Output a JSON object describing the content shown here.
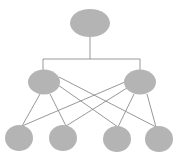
{
  "diagram": {
    "type": "hierarchy",
    "colors": {
      "node_fill": "#b4b4b4",
      "edge": "#8c8c8c",
      "background": "#ffffff"
    },
    "nodes": [
      {
        "id": "root",
        "level": 0,
        "cx": 90,
        "cy": 23,
        "rx": 20,
        "ry": 14
      },
      {
        "id": "mid-left",
        "level": 1,
        "cx": 44,
        "cy": 82,
        "rx": 16,
        "ry": 12.5
      },
      {
        "id": "mid-right",
        "level": 1,
        "cx": 140,
        "cy": 82,
        "rx": 16,
        "ry": 12.5
      },
      {
        "id": "leaf-1",
        "level": 2,
        "cx": 19,
        "cy": 138,
        "rx": 14,
        "ry": 13
      },
      {
        "id": "leaf-2",
        "level": 2,
        "cx": 63,
        "cy": 138,
        "rx": 14,
        "ry": 13
      },
      {
        "id": "leaf-3",
        "level": 2,
        "cx": 117,
        "cy": 139,
        "rx": 14,
        "ry": 13
      },
      {
        "id": "leaf-4",
        "level": 2,
        "cx": 159,
        "cy": 139,
        "rx": 14,
        "ry": 13
      }
    ],
    "edges": [
      {
        "from": "root",
        "to": "mid-left",
        "style": "elbow"
      },
      {
        "from": "root",
        "to": "mid-right",
        "style": "elbow"
      },
      {
        "from": "mid-left",
        "to": "leaf-1"
      },
      {
        "from": "mid-left",
        "to": "leaf-2"
      },
      {
        "from": "mid-left",
        "to": "leaf-3"
      },
      {
        "from": "mid-left",
        "to": "leaf-4"
      },
      {
        "from": "mid-right",
        "to": "leaf-1"
      },
      {
        "from": "mid-right",
        "to": "leaf-2"
      },
      {
        "from": "mid-right",
        "to": "leaf-3"
      },
      {
        "from": "mid-right",
        "to": "leaf-4"
      }
    ]
  }
}
